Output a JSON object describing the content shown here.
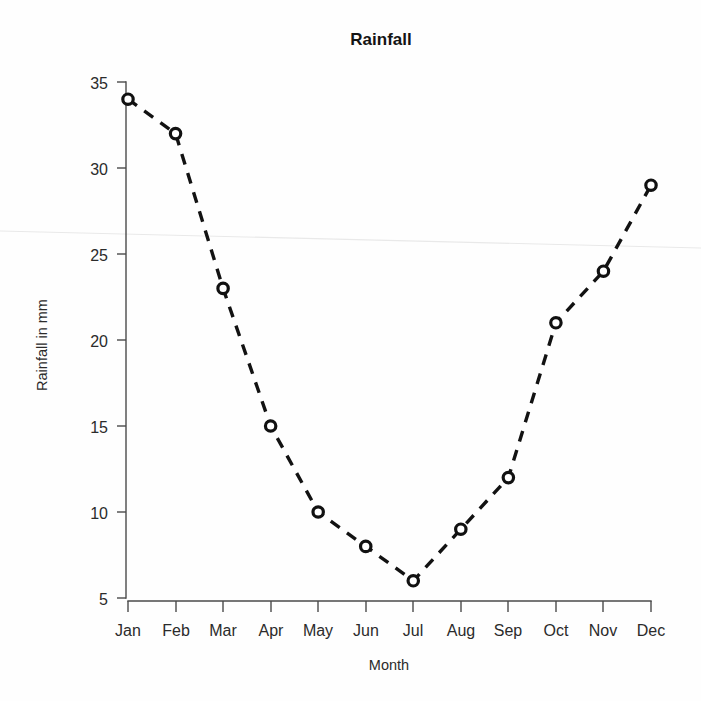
{
  "chart_data": {
    "type": "line",
    "title": "Rainfall",
    "xlabel": "Month",
    "ylabel": "Rainfall in mm",
    "categories": [
      "Jan",
      "Feb",
      "Mar",
      "Apr",
      "May",
      "Jun",
      "Jul",
      "Aug",
      "Sep",
      "Oct",
      "Nov",
      "Dec"
    ],
    "values": [
      34,
      32,
      23,
      15,
      10,
      8,
      6,
      9,
      12,
      21,
      24,
      29
    ],
    "series": [
      {
        "name": "Rainfall in mm",
        "values": [
          34,
          32,
          23,
          15,
          10,
          8,
          6,
          9,
          12,
          21,
          24,
          29
        ]
      }
    ],
    "ylim": [
      5,
      35
    ],
    "yticks": [
      5,
      10,
      15,
      20,
      25,
      30,
      35
    ],
    "ytick_labels": [
      "5",
      "10",
      "15",
      "20",
      "25",
      "30",
      "35"
    ],
    "xtick_labels": [
      "Jan",
      "Feb",
      "Mar",
      "Apr",
      "May",
      "Jun",
      "Jul",
      "Aug",
      "Sep",
      "Oct",
      "Nov",
      "Dec"
    ],
    "grid": false,
    "legend": false,
    "legend_position": "none",
    "line_style": "dashed",
    "marker_style": "open-circle",
    "line_color": "#121212",
    "marker_fill_color": "#ffffff",
    "marker_edge_color": "#111111",
    "background_color": "#ffffff",
    "axis_color": "#4a4a4a"
  },
  "labels": {
    "title": "Rainfall",
    "y_axis_title": "Rainfall in mm",
    "x_axis_title": "Month"
  }
}
